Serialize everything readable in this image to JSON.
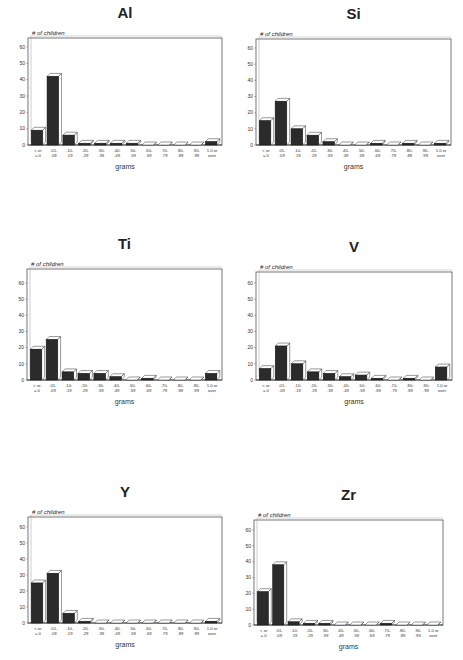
{
  "chart_data": [
    {
      "type": "bar",
      "title": "Al",
      "ylabel": "# of children",
      "xlabel": "grams",
      "ylim": [
        0,
        60
      ],
      "yticks": [
        0,
        10,
        20,
        30,
        40,
        50,
        60
      ],
      "categories": [
        "< or = 0",
        ".01-.09",
        ".10-.19",
        ".20-.29",
        ".30-.39",
        ".40-.49",
        ".50-.59",
        ".60-.69",
        ".70-.79",
        ".80-.89",
        ".90-.99",
        "1.0 or over"
      ],
      "values": [
        9,
        42,
        6,
        1,
        1,
        1,
        1,
        0,
        0,
        0,
        0,
        2
      ],
      "grid": false,
      "style": "3d-bar",
      "frame": {
        "left": 28,
        "top": 38,
        "right": 222,
        "zero": 145,
        "y60": 47
      }
    },
    {
      "type": "bar",
      "title": "Si",
      "ylabel": "# of children",
      "xlabel": "grams",
      "ylim": [
        0,
        60
      ],
      "yticks": [
        0,
        10,
        20,
        30,
        40,
        50,
        60
      ],
      "categories": [
        "< or = 0",
        ".01-.09",
        ".10-.19",
        ".20-.29",
        ".30-.39",
        ".40-.49",
        ".50-.59",
        ".60-.69",
        ".70-.79",
        ".80-.89",
        ".90-.99",
        "1.0 or over"
      ],
      "values": [
        15,
        27,
        10,
        6,
        2,
        0,
        0,
        1,
        0,
        1,
        0,
        1
      ],
      "grid": false,
      "style": "3d-bar",
      "frame": {
        "left": 256,
        "top": 39,
        "right": 451,
        "zero": 145,
        "y60": 48
      }
    },
    {
      "type": "bar",
      "title": "Ti",
      "ylabel": "# of children",
      "xlabel": "grams",
      "ylim": [
        0,
        60
      ],
      "yticks": [
        0,
        10,
        20,
        30,
        40,
        50,
        60
      ],
      "categories": [
        "< or = 0",
        ".01-.09",
        ".10-.19",
        ".20-.29",
        ".30-.39",
        ".40-.49",
        ".50-.59",
        ".60-.69",
        ".70-.79",
        ".80-.89",
        ".90-.99",
        "1.0 or over"
      ],
      "values": [
        19,
        25,
        5,
        4,
        4,
        2,
        0,
        1,
        0,
        0,
        0,
        4
      ],
      "grid": false,
      "style": "3d-bar",
      "frame": {
        "left": 27,
        "top": 269,
        "right": 222,
        "zero": 380,
        "y60": 283
      }
    },
    {
      "type": "bar",
      "title": "V",
      "ylabel": "# of children",
      "xlabel": "grams",
      "ylim": [
        0,
        60
      ],
      "yticks": [
        0,
        10,
        20,
        30,
        40,
        50,
        60
      ],
      "categories": [
        "< or = 0",
        ".01-.09",
        ".10-.19",
        ".20-.29",
        ".30-.39",
        ".40-.49",
        ".50-.59",
        ".60-.69",
        ".70-.79",
        ".80-.89",
        ".90-.99",
        "1.0 or over"
      ],
      "values": [
        7,
        21,
        10,
        5,
        4,
        2,
        3,
        1,
        0,
        1,
        0,
        8
      ],
      "grid": false,
      "style": "3d-bar",
      "frame": {
        "left": 256,
        "top": 272,
        "right": 452,
        "zero": 380,
        "y60": 283
      }
    },
    {
      "type": "bar",
      "title": "Y",
      "ylabel": "# of children",
      "xlabel": "grams",
      "ylim": [
        0,
        60
      ],
      "yticks": [
        0,
        10,
        20,
        30,
        40,
        50,
        60
      ],
      "categories": [
        "< or = 0",
        ".01-.09",
        ".10-.19",
        ".20-.29",
        ".30-.39",
        ".40-.49",
        ".50-.59",
        ".60-.69",
        ".70-.79",
        ".80-.89",
        ".90-.99",
        "1.0 or over"
      ],
      "values": [
        25,
        31,
        6,
        1,
        0,
        0,
        0,
        0,
        0,
        0,
        0,
        1
      ],
      "grid": false,
      "style": "3d-bar",
      "frame": {
        "left": 28,
        "top": 517,
        "right": 222,
        "zero": 623,
        "y60": 527
      }
    },
    {
      "type": "bar",
      "title": "Zr",
      "ylabel": "# of children",
      "xlabel": "grams",
      "ylim": [
        0,
        60
      ],
      "yticks": [
        0,
        10,
        20,
        30,
        40,
        50,
        60
      ],
      "categories": [
        "< or = 0",
        ".01-.09",
        ".10-.19",
        ".20-.29",
        ".30-.39",
        ".40-.49",
        ".50-.59",
        ".60-.69",
        ".70-.79",
        ".80-.89",
        ".90-.99",
        "1.0 or over"
      ],
      "values": [
        21,
        38,
        2,
        1,
        1,
        0,
        0,
        0,
        1,
        0,
        0,
        0
      ],
      "grid": false,
      "style": "3d-bar",
      "frame": {
        "left": 254,
        "top": 520,
        "right": 443,
        "zero": 625,
        "y60": 530
      }
    }
  ],
  "colors": {
    "bar_fill": "#2b2b2b",
    "bar_top": "#ffffff",
    "frame": "#555555",
    "text": "#222222"
  }
}
